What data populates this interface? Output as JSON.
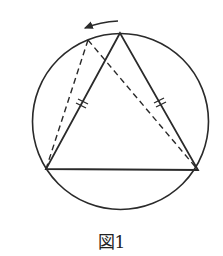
{
  "figure": {
    "caption": "図1",
    "stroke_color": "#2a2a2a",
    "circle": {
      "cx": 120.5,
      "cy": 121.5,
      "r": 88
    },
    "triangle": {
      "apex": [
        120,
        33
      ],
      "bottom_left": [
        46,
        169
      ],
      "bottom_right": [
        198,
        170
      ]
    },
    "moved_apex": [
      88,
      40
    ],
    "arrow": {
      "from": [
        117,
        22
      ],
      "to": [
        83,
        28
      ],
      "direction": "counterclockwise"
    },
    "equal_marks": "double tick marks on both equal sides"
  }
}
